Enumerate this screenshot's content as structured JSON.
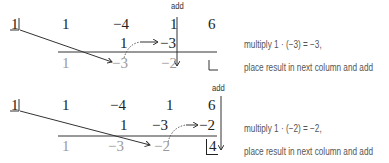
{
  "panels": [
    {
      "add_label": "add",
      "divisor": "1",
      "coefficients": [
        "1",
        "−4",
        "1",
        "6"
      ],
      "middle_row": [
        "1",
        "−3"
      ],
      "bottom_row": [
        "1",
        "−3",
        "−2"
      ],
      "remainder": "",
      "note_line1": "multiply 1 · (−3) = −3,",
      "note_line2": "place result in next column and add"
    },
    {
      "add_label": "add",
      "divisor": "1",
      "coefficients": [
        "1",
        "−4",
        "1",
        "6"
      ],
      "middle_row": [
        "1",
        "−3",
        "−2"
      ],
      "bottom_row": [
        "1",
        "−3",
        "−2"
      ],
      "remainder": "4",
      "note_line1": "multiply 1 · (−2) = −2,",
      "note_line2": "place result in next column and add"
    }
  ],
  "colors": {
    "text": "#222222",
    "gray_text": "#9a9a9a",
    "note_text": "#555555"
  }
}
